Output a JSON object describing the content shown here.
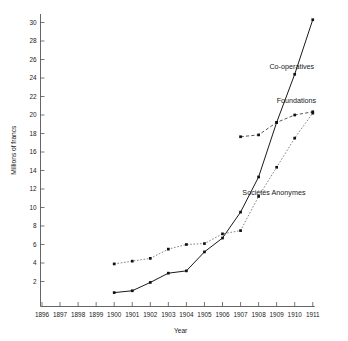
{
  "chart_data": {
    "type": "line",
    "title": "",
    "xlabel": "Year",
    "ylabel": "Millions of francs",
    "x": [
      1896,
      1897,
      1898,
      1899,
      1900,
      1901,
      1902,
      1903,
      1904,
      1905,
      1906,
      1907,
      1908,
      1909,
      1910,
      1911
    ],
    "xlim": [
      1896,
      1911
    ],
    "ylim": [
      0,
      31.5
    ],
    "yticks": [
      2,
      4,
      6,
      8,
      10,
      12,
      14,
      16,
      18,
      20,
      22,
      24,
      26,
      28,
      30
    ],
    "ytick_labels": [
      "2",
      "4",
      "6",
      "8",
      "10",
      "12",
      "14",
      "16",
      "18",
      "20",
      "22",
      "24",
      "26",
      "28",
      "30"
    ],
    "xtick_labels": [
      "1896",
      "1897",
      "1898",
      "1899",
      "1900",
      "1901",
      "1902",
      "1903",
      "1904",
      "1905",
      "1906",
      "1907",
      "1908",
      "1909",
      "1910",
      "1911"
    ],
    "grid": false,
    "legend_position": "inline-annotations",
    "series": [
      {
        "name": "Co-operatives",
        "style": "solid",
        "color": "#1a1a1a",
        "marker": "square",
        "label_x": 1908.6,
        "label_y": 25.0,
        "points": [
          {
            "x": 1900,
            "y": 0.8
          },
          {
            "x": 1901,
            "y": 1.0
          },
          {
            "x": 1902,
            "y": 1.9
          },
          {
            "x": 1903,
            "y": 2.9
          },
          {
            "x": 1904,
            "y": 3.15
          },
          {
            "x": 1905,
            "y": 5.2
          },
          {
            "x": 1906,
            "y": 6.7
          },
          {
            "x": 1907,
            "y": 9.5
          },
          {
            "x": 1908,
            "y": 13.3
          },
          {
            "x": 1909,
            "y": 19.2
          },
          {
            "x": 1910,
            "y": 24.4
          },
          {
            "x": 1911,
            "y": 30.3
          }
        ]
      },
      {
        "name": "Foundations",
        "style": "dashed",
        "color": "#3a3a3a",
        "marker": "square",
        "label_x": 1909.0,
        "label_y": 21.3,
        "points": [
          {
            "x": 1907,
            "y": 17.65
          },
          {
            "x": 1908,
            "y": 17.85
          },
          {
            "x": 1909,
            "y": 19.2
          },
          {
            "x": 1910,
            "y": 20.0
          },
          {
            "x": 1911,
            "y": 20.35
          }
        ]
      },
      {
        "name": "Sociétés Anonymes",
        "style": "dotted",
        "color": "#6e6e6e",
        "marker": "square",
        "label_x": 1907.1,
        "label_y": 11.4,
        "points": [
          {
            "x": 1900,
            "y": 3.9
          },
          {
            "x": 1901,
            "y": 4.2
          },
          {
            "x": 1902,
            "y": 4.5
          },
          {
            "x": 1903,
            "y": 5.5
          },
          {
            "x": 1904,
            "y": 6.0
          },
          {
            "x": 1905,
            "y": 6.1
          },
          {
            "x": 1906,
            "y": 7.15
          },
          {
            "x": 1907,
            "y": 7.5
          },
          {
            "x": 1908,
            "y": 11.2
          },
          {
            "x": 1909,
            "y": 14.35
          },
          {
            "x": 1910,
            "y": 17.5
          },
          {
            "x": 1911,
            "y": 20.2
          }
        ]
      }
    ]
  }
}
